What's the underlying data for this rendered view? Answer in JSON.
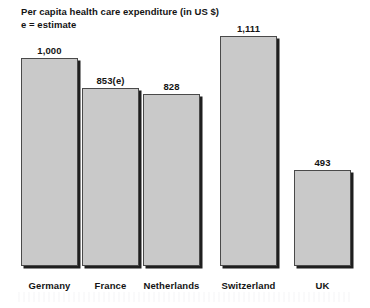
{
  "chart_data": {
    "type": "bar",
    "title": "Per capita health care expenditure (in US $)",
    "subtitle": "e = estimate",
    "xlabel": "",
    "ylabel": "",
    "ylim": [
      0,
      1111
    ],
    "grid": false,
    "legend": "none",
    "categories": [
      "Germany",
      "France",
      "Netherlands",
      "Switzerland",
      "UK"
    ],
    "values": [
      1000,
      853,
      828,
      1111,
      493
    ],
    "value_labels": [
      "1,000",
      "853(e)",
      "828",
      "1,111",
      "493"
    ],
    "estimate_flags": [
      false,
      true,
      false,
      false,
      false
    ],
    "bar_fill_color": "#c9c9c9",
    "bar_border_color": "#4a4a4a",
    "bar_shadow_color": "#1f1f1f",
    "text_color": "#141414",
    "background_color": "#ffffff"
  },
  "bars": [
    {
      "label": "Germany",
      "value_label": "1,000",
      "left": 21,
      "width": 57,
      "top": 58,
      "height": 208
    },
    {
      "label": "France",
      "value_label": "853(e)",
      "left": 82,
      "width": 57,
      "top": 88,
      "height": 178
    },
    {
      "label": "Netherlands",
      "value_label": "828",
      "left": 143,
      "width": 57,
      "top": 94,
      "height": 172
    },
    {
      "label": "Switzerland",
      "value_label": "1,111",
      "left": 220,
      "width": 57,
      "top": 36,
      "height": 230
    },
    {
      "label": "UK",
      "value_label": "493",
      "left": 294,
      "width": 57,
      "top": 170,
      "height": 96
    }
  ]
}
